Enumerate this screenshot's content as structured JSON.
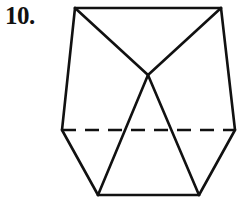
{
  "problem": {
    "number_label": "10."
  },
  "figure": {
    "stroke_color": "#111111",
    "stroke_width": 2.6,
    "dash_pattern": "14 9",
    "vertices": {
      "top_left": [
        75,
        8
      ],
      "top_right": [
        221,
        8
      ],
      "apex": [
        148,
        75
      ],
      "mid_left": [
        62,
        130
      ],
      "mid_right": [
        235,
        130
      ],
      "bottom_left": [
        98,
        195
      ],
      "bottom_right": [
        199,
        195
      ]
    },
    "solid_edges": [
      [
        "top_left",
        "top_right"
      ],
      [
        "top_left",
        "mid_left"
      ],
      [
        "top_right",
        "mid_right"
      ],
      [
        "mid_left",
        "bottom_left"
      ],
      [
        "mid_right",
        "bottom_right"
      ],
      [
        "bottom_left",
        "bottom_right"
      ],
      [
        "top_left",
        "apex"
      ],
      [
        "top_right",
        "apex"
      ],
      [
        "apex",
        "bottom_left"
      ],
      [
        "apex",
        "bottom_right"
      ]
    ],
    "dashed_edges": [
      [
        "mid_left",
        "mid_right"
      ]
    ]
  }
}
